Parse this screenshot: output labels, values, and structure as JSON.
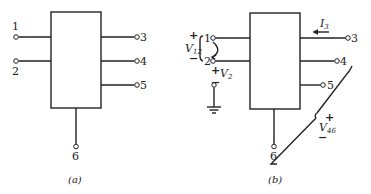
{
  "diagram": {
    "panels": [
      {
        "caption": "(a)",
        "terminals": [
          "1",
          "2",
          "3",
          "4",
          "5",
          "6"
        ]
      },
      {
        "caption": "(b)",
        "terminals": [
          "1",
          "2",
          "3",
          "4",
          "5",
          "6"
        ],
        "annotations": {
          "v12": {
            "symbol": "V",
            "sub": "12",
            "plus": "+",
            "minus": "−"
          },
          "v2": {
            "symbol": "V",
            "sub": "2",
            "plus": "+",
            "minus": "−"
          },
          "i3": {
            "symbol": "I",
            "sub": "3"
          },
          "v46": {
            "symbol": "V",
            "sub": "46",
            "plus": "+",
            "minus": "−"
          }
        }
      }
    ]
  }
}
